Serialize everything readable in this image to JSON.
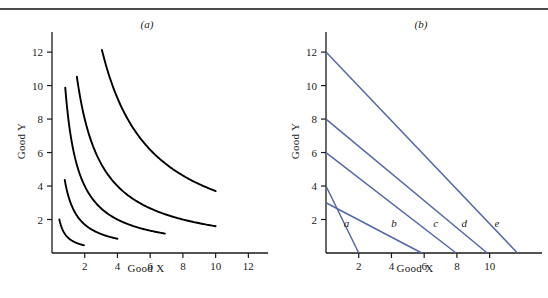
{
  "figure": {
    "panels": [
      {
        "id": "a",
        "label": "(a)",
        "xlabel": "Good X",
        "ylabel": "Good Y"
      },
      {
        "id": "b",
        "label": "(b)",
        "xlabel": "Good X",
        "ylabel": "Good Y"
      }
    ]
  },
  "colors": {
    "curve_black": "#000000",
    "line_blue": "#5568a8",
    "axis": "#1a1a1a",
    "rule": "#4a4a4a"
  },
  "chart_data": [
    {
      "type": "line",
      "panel": "a",
      "title": "(a)",
      "xlabel": "Good X",
      "ylabel": "Good Y",
      "xlim": [
        0,
        13
      ],
      "ylim": [
        0,
        13
      ],
      "xticks": [
        2,
        4,
        6,
        8,
        10,
        12
      ],
      "yticks": [
        2,
        4,
        6,
        8,
        10,
        12
      ],
      "xticklabels": [
        "2",
        "4",
        "6",
        "8",
        "10",
        "12"
      ],
      "yticklabels": [
        "2",
        "4",
        "6",
        "8",
        "10",
        "12"
      ],
      "grid": false,
      "legend": "none",
      "description": "Five convex indifference curves of form x*y = k",
      "series": [
        {
          "name": "indifference-curve-1",
          "k": 0.9,
          "x_start": 0.45,
          "x_end": 1.95,
          "color": "#000000"
        },
        {
          "name": "indifference-curve-2",
          "k": 3.4,
          "x_start": 0.78,
          "x_end": 4.0,
          "color": "#000000"
        },
        {
          "name": "indifference-curve-3",
          "k": 8.0,
          "x_start": 0.81,
          "x_end": 6.9,
          "color": "#000000"
        },
        {
          "name": "indifference-curve-4",
          "k": 16.0,
          "x_start": 1.52,
          "x_end": 10.0,
          "color": "#000000"
        },
        {
          "name": "indifference-curve-5",
          "k": 37.0,
          "x_start": 3.05,
          "x_end": 10.0,
          "color": "#000000"
        }
      ]
    },
    {
      "type": "line",
      "panel": "b",
      "title": "(b)",
      "xlabel": "Good X",
      "ylabel": "Good Y",
      "xlim": [
        0,
        13
      ],
      "ylim": [
        0,
        13
      ],
      "xticks": [
        2,
        4,
        6,
        8,
        10
      ],
      "yticks": [
        2,
        4,
        6,
        8,
        10,
        12
      ],
      "xticklabels": [
        "2",
        "4",
        "6",
        "8",
        "10"
      ],
      "yticklabels": [
        "2",
        "4",
        "6",
        "8",
        "10",
        "12"
      ],
      "grid": false,
      "legend": "inline-labels",
      "description": "Five straight budget lines labeled a through e",
      "series": [
        {
          "name": "budget-line-a",
          "label": "a",
          "y_intercept": 4.0,
          "x_intercept": 2.0,
          "slope": -2.0,
          "label_x": 1.25,
          "label_y": 1.55,
          "color": "#5568a8"
        },
        {
          "name": "budget-line-b",
          "label": "b",
          "y_intercept": 3.0,
          "x_intercept": 5.85,
          "slope": -0.513,
          "label_x": 4.15,
          "label_y": 1.55,
          "color": "#5568a8"
        },
        {
          "name": "budget-line-c",
          "label": "c",
          "y_intercept": 6.0,
          "x_intercept": 7.95,
          "slope": -0.755,
          "label_x": 6.7,
          "label_y": 1.55,
          "color": "#5568a8"
        },
        {
          "name": "budget-line-d",
          "label": "d",
          "y_intercept": 8.0,
          "x_intercept": 9.85,
          "slope": -0.812,
          "label_x": 8.45,
          "label_y": 1.55,
          "color": "#5568a8"
        },
        {
          "name": "budget-line-e",
          "label": "e",
          "y_intercept": 12.0,
          "x_intercept": 11.7,
          "slope": -1.026,
          "label_x": 10.45,
          "label_y": 1.55,
          "color": "#5568a8"
        }
      ]
    }
  ]
}
